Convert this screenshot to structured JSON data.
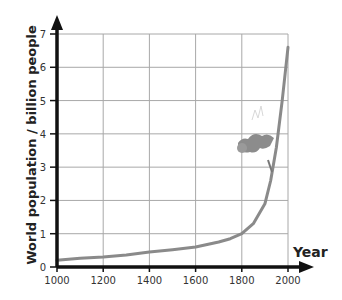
{
  "chart_data": {
    "type": "line",
    "title": "",
    "xlabel": "Year",
    "ylabel": "World population / billion people",
    "xlim": [
      1000,
      2000
    ],
    "ylim": [
      0,
      7
    ],
    "grid": true,
    "legend": null,
    "x_ticks": [
      "1000",
      "1200",
      "1400",
      "1600",
      "1800",
      "2000"
    ],
    "y_ticks": [
      "0",
      "1",
      "2",
      "3",
      "4",
      "5",
      "6",
      "7"
    ],
    "series": [
      {
        "name": "World population",
        "color": "#8a8a8a",
        "x": [
          1000,
          1100,
          1200,
          1300,
          1400,
          1500,
          1600,
          1700,
          1750,
          1800,
          1850,
          1900,
          1925,
          1950,
          1975,
          2000
        ],
        "y": [
          0.2,
          0.26,
          0.3,
          0.36,
          0.45,
          0.52,
          0.6,
          0.75,
          0.85,
          1.0,
          1.3,
          1.9,
          2.6,
          3.6,
          5.0,
          6.6
        ]
      }
    ],
    "annotations": [
      "small illustration of a climber on the curve near 1900–1950"
    ]
  },
  "labels": {
    "ylabel": "World population / billion people",
    "xlabel": "Year"
  },
  "ticks": {
    "y": [
      "0",
      "1",
      "2",
      "3",
      "4",
      "5",
      "6",
      "7"
    ],
    "x": [
      "1000",
      "1200",
      "1400",
      "1600",
      "1800",
      "2000"
    ]
  }
}
